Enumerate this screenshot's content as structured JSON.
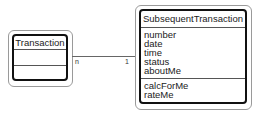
{
  "diagram": {
    "type": "uml-class",
    "classes": [
      {
        "name": "Transaction",
        "attributes": [],
        "operations": []
      },
      {
        "name": "SubsequentTransaction",
        "attributes": [
          "number",
          "date",
          "time",
          "status",
          "aboutMe"
        ],
        "operations": [
          "calcForMe",
          "rateMe"
        ]
      }
    ],
    "associations": [
      {
        "from": "Transaction",
        "to": "SubsequentTransaction",
        "from_multiplicity": "n",
        "to_multiplicity": "1"
      }
    ]
  }
}
